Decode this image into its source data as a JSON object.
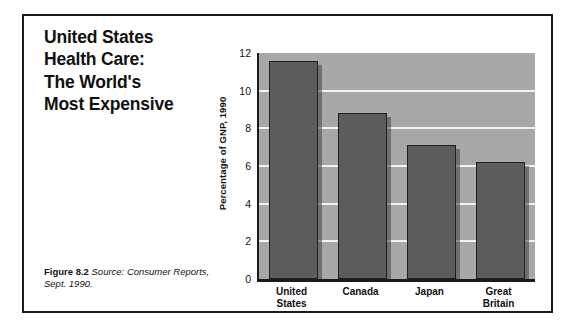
{
  "figure": {
    "title_lines": [
      "United States",
      "Health Care:",
      "The World's",
      "Most Expensive"
    ],
    "caption_label": "Figure 8.2",
    "caption_source": " Source: Consumer Reports, Sept. 1990."
  },
  "colors": {
    "plot_background": "#a8a8a8",
    "bar_fill": "#5c5c5c",
    "bar_outline": "#1f1f1f",
    "gridline": "#f2f2f2",
    "frame": "#1b1b1b",
    "text": "#111111",
    "page_background": "#ffffff"
  },
  "chart_data": {
    "type": "bar",
    "title": "United States Health Care: The World's Most Expensive",
    "categories": [
      "United States",
      "Canada",
      "Japan",
      "Great Britain"
    ],
    "category_lines": [
      [
        "United",
        "States"
      ],
      [
        "Canada"
      ],
      [
        "Japan"
      ],
      [
        "Great",
        "Britain"
      ]
    ],
    "values": [
      11.6,
      8.8,
      7.1,
      6.2
    ],
    "xlabel": "",
    "ylabel": "Percentage of GNP, 1990",
    "ylim": [
      0,
      12
    ],
    "yticks": [
      0,
      2,
      4,
      6,
      8,
      10,
      12
    ],
    "ytick_labels": [
      "0",
      "2",
      "4",
      "6",
      "8",
      "10",
      "12"
    ],
    "grid": true,
    "grid_axis": "y",
    "legend": false,
    "source": "Consumer Reports, Sept. 1990"
  }
}
